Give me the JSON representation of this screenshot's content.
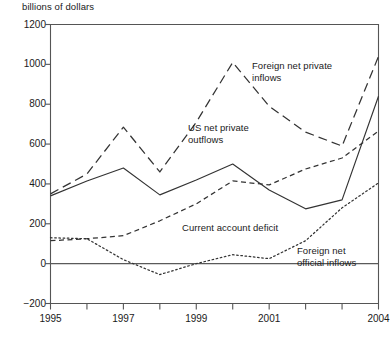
{
  "axis_title": "billions of dollars",
  "yticks": [
    {
      "value": 1200,
      "label": "1200"
    },
    {
      "value": 1000,
      "label": "1000"
    },
    {
      "value": 800,
      "label": "800"
    },
    {
      "value": 600,
      "label": "600"
    },
    {
      "value": 400,
      "label": "400"
    },
    {
      "value": 200,
      "label": "200"
    },
    {
      "value": 0,
      "label": "0"
    },
    {
      "value": -200,
      "label": "−200"
    }
  ],
  "xticks": [
    {
      "value": 1995,
      "label": "1995"
    },
    {
      "value": 1996,
      "label": ""
    },
    {
      "value": 1997,
      "label": "1997"
    },
    {
      "value": 1998,
      "label": ""
    },
    {
      "value": 1999,
      "label": "1999"
    },
    {
      "value": 2000,
      "label": ""
    },
    {
      "value": 2001,
      "label": "2001"
    },
    {
      "value": 2002,
      "label": ""
    },
    {
      "value": 2003,
      "label": ""
    },
    {
      "value": 2004,
      "label": "2004"
    }
  ],
  "annotations": [
    {
      "name": "foreign-net-private-inflows-label",
      "text": "Foreign net private\ninflows",
      "x": 252,
      "y": 60
    },
    {
      "name": "us-net-private-outflows-label",
      "text": "US net private\noutflows",
      "x": 188,
      "y": 122
    },
    {
      "name": "current-account-deficit-label",
      "text": "Current account deficit",
      "x": 182,
      "y": 222
    },
    {
      "name": "foreign-net-official-inflows-label",
      "text": "Foreign net\nofficial inflows",
      "x": 297,
      "y": 245
    }
  ],
  "chart_data": {
    "type": "line",
    "title": "",
    "subtitle": "",
    "xlabel": "",
    "ylabel": "billions of dollars",
    "ylim": [
      -200,
      1200
    ],
    "xlim": [
      1995,
      2004
    ],
    "grid": false,
    "legend": "inline-annotations",
    "x": [
      1995,
      1996,
      1997,
      1998,
      1999,
      2000,
      2001,
      2002,
      2003,
      2004
    ],
    "series": [
      {
        "name": "US net private outflows",
        "style": "solid",
        "color": "#333333",
        "values": [
          340,
          415,
          480,
          345,
          420,
          500,
          370,
          275,
          320,
          840
        ]
      },
      {
        "name": "Foreign net private inflows",
        "style": "long-dash",
        "color": "#333333",
        "values": [
          350,
          450,
          685,
          460,
          710,
          1010,
          790,
          660,
          590,
          1040
        ]
      },
      {
        "name": "Current account deficit",
        "style": "short-dash",
        "color": "#333333",
        "values": [
          115,
          125,
          140,
          215,
          300,
          415,
          395,
          475,
          530,
          665
        ]
      },
      {
        "name": "Foreign net official inflows",
        "style": "dotted",
        "color": "#333333",
        "values": [
          130,
          125,
          20,
          -55,
          0,
          45,
          25,
          115,
          280,
          405
        ]
      }
    ]
  },
  "colors": {
    "axis": "#555555",
    "line": "#333333",
    "text": "#1a1a1a"
  }
}
